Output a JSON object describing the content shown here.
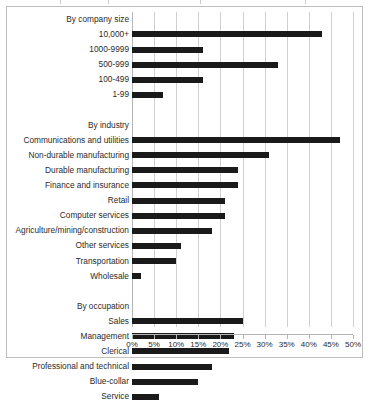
{
  "chart_data": {
    "type": "bar",
    "orientation": "horizontal",
    "title": "",
    "xlabel": "",
    "ylabel": "",
    "xlim": [
      0,
      50
    ],
    "xtick_labels": [
      "0%",
      "5%",
      "10%",
      "15%",
      "20%",
      "25%",
      "30%",
      "35%",
      "40%",
      "45%",
      "50%"
    ],
    "xtick_values": [
      0,
      5,
      10,
      15,
      20,
      25,
      30,
      35,
      40,
      45,
      50
    ],
    "grid": true,
    "legend": "none",
    "bar_color": "#1a1a1a",
    "gridline_color": "#d0d0d0",
    "border_color": "#bfbfbf",
    "rows": [
      {
        "label": "By company size",
        "value": null,
        "kind": "group-header"
      },
      {
        "label": "10,000+",
        "value": 43,
        "kind": "bar"
      },
      {
        "label": "1000-9999",
        "value": 16,
        "kind": "bar"
      },
      {
        "label": "500-999",
        "value": 33,
        "kind": "bar"
      },
      {
        "label": "100-499",
        "value": 16,
        "kind": "bar"
      },
      {
        "label": "1-99",
        "value": 7,
        "kind": "bar"
      },
      {
        "label": "",
        "value": null,
        "kind": "spacer"
      },
      {
        "label": "By industry",
        "value": null,
        "kind": "group-header"
      },
      {
        "label": "Communications and utilities",
        "value": 47,
        "kind": "bar"
      },
      {
        "label": "Non-durable manufacturing",
        "value": 31,
        "kind": "bar"
      },
      {
        "label": "Durable manufacturing",
        "value": 24,
        "kind": "bar"
      },
      {
        "label": "Finance and insurance",
        "value": 24,
        "kind": "bar"
      },
      {
        "label": "Retail",
        "value": 21,
        "kind": "bar"
      },
      {
        "label": "Computer services",
        "value": 21,
        "kind": "bar"
      },
      {
        "label": "Agriculture/mining/construction",
        "value": 18,
        "kind": "bar"
      },
      {
        "label": "Other services",
        "value": 11,
        "kind": "bar"
      },
      {
        "label": "Transportation",
        "value": 10,
        "kind": "bar"
      },
      {
        "label": "Wholesale",
        "value": 2,
        "kind": "bar"
      },
      {
        "label": "",
        "value": null,
        "kind": "spacer"
      },
      {
        "label": "By occupation",
        "value": null,
        "kind": "group-header"
      },
      {
        "label": "Sales",
        "value": 25,
        "kind": "bar"
      },
      {
        "label": "Management",
        "value": 23,
        "kind": "bar"
      },
      {
        "label": "Clerical",
        "value": 22,
        "kind": "bar"
      },
      {
        "label": "Professional and technical",
        "value": 18,
        "kind": "bar"
      },
      {
        "label": "Blue-collar",
        "value": 15,
        "kind": "bar"
      },
      {
        "label": "Service",
        "value": 6,
        "kind": "bar"
      }
    ]
  }
}
